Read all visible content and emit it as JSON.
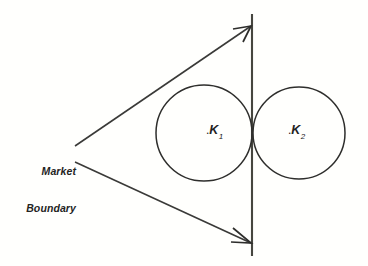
{
  "figure": {
    "background_color": "#fffffd",
    "line_color": "#2e2e2c",
    "axis_color": "#46463f",
    "text_color": "#24241f"
  },
  "labels": {
    "market_boundary": {
      "line1": "Market",
      "line2": "Boundary"
    },
    "k1": {
      "dot": ".",
      "letter": "K",
      "subscript": "1"
    },
    "k2": {
      "dot": ".",
      "letter": "K",
      "subscript": "2"
    }
  },
  "geometry": {
    "canvas": {
      "width": 368,
      "height": 266
    },
    "vertical_axis": {
      "x": 252,
      "y_top": 14,
      "y_bottom": 256
    },
    "circles": [
      {
        "name": "K1",
        "cx": 204,
        "cy": 133,
        "r": 48
      },
      {
        "name": "K2",
        "cx": 299,
        "cy": 133,
        "r": 46
      }
    ],
    "arrows": [
      {
        "name": "upper-boundary-arrow",
        "x1": 75,
        "y1": 146,
        "x2": 252,
        "y2": 26
      },
      {
        "name": "lower-boundary-arrow",
        "x1": 75,
        "y1": 162,
        "x2": 252,
        "y2": 243
      }
    ]
  }
}
